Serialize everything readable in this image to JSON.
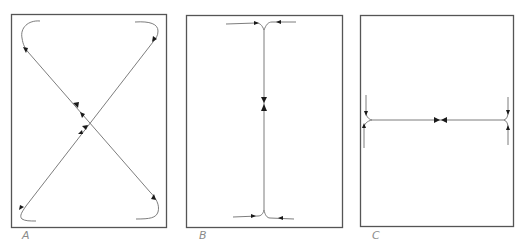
{
  "figure": {
    "panels": [
      {
        "id": "A",
        "label": "A",
        "description": "Two crossing trajectories forming an X with curled ends; arrows converge toward the center crossing"
      },
      {
        "id": "B",
        "label": "B",
        "description": "Vertical trajectory with T-junctions at top and bottom; arrows converge toward center"
      },
      {
        "id": "C",
        "label": "C",
        "description": "Horizontal trajectory with T-junctions at left and right; arrows converge toward center"
      }
    ],
    "caption_fragment": "",
    "colors": {
      "frame": "#555555",
      "trajectory": "#6e6e6e",
      "arrowhead": "#1a1a1a",
      "label": "#8a8a8a"
    }
  }
}
